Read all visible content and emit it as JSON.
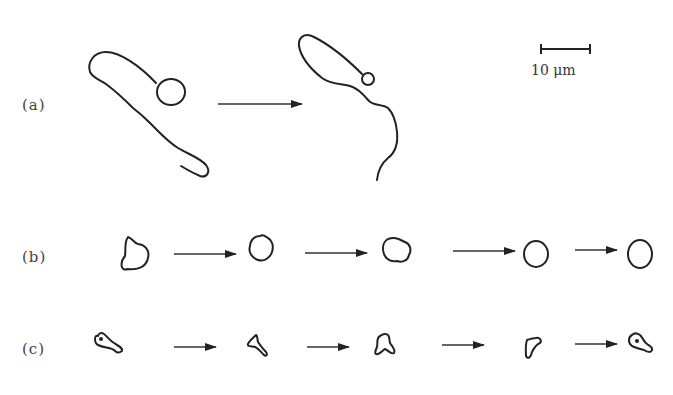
{
  "figure": {
    "rows": [
      {
        "id": "a",
        "label": "(a)",
        "description": "elongated cell with round head transforming into cell with small head and long wavy tail",
        "stages": 2
      },
      {
        "id": "b",
        "label": "(b)",
        "description": "irregular blob cell becoming progressively rounder",
        "stages": 5
      },
      {
        "id": "c",
        "label": "(c)",
        "description": "small keyhole-shaped cell changing through triangular/amoeboid forms back to keyhole shape",
        "stages": 5
      }
    ],
    "scale_bar": {
      "label": "10 μm",
      "value": 10,
      "unit": "μm"
    }
  }
}
